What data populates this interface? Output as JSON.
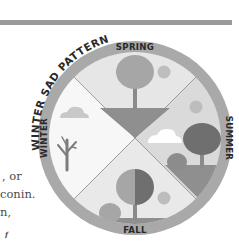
{
  "diagram": {
    "title": "WINTER SAD PATTERN",
    "seasons": [
      {
        "name": "SPRING",
        "position": "top"
      },
      {
        "name": "SUMMER",
        "position": "right"
      },
      {
        "name": "FALL",
        "position": "bottom"
      },
      {
        "name": "WINTER",
        "position": "left"
      }
    ],
    "colors": {
      "ring": "#a9a9a9",
      "spring_bg": "#e6e6e6",
      "summer_bg": "#dadada",
      "fall_bg": "#e9e9e9",
      "winter_bg": "#f7f7f7",
      "ground": "#8f8f8f",
      "tree_light": "#a6a6a6",
      "tree_dark": "#6f6f6f",
      "sun": "#bdbdbd",
      "cloud_light": "#c8c8c8",
      "cloud_white": "#ffffff",
      "bare_tree": "#7d7d7d"
    }
  },
  "body_text": {
    "fragments": [
      ", or",
      "conin.",
      "n,",
      "f"
    ]
  },
  "page": {
    "rule_color": "#9a9a9a"
  }
}
